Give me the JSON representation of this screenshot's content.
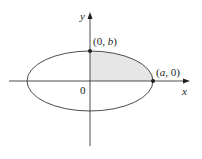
{
  "diagram": {
    "type": "ellipse-quadrant",
    "colors": {
      "stroke": "#3a3a3a",
      "shade": "#e6e6e6",
      "background": "#ffffff"
    },
    "axes": {
      "x_label": "x",
      "y_label": "y",
      "origin_label": "0"
    },
    "points": [
      {
        "label_open": "(0, ",
        "label_var": "b",
        "label_close": ")"
      },
      {
        "label_open": "(",
        "label_var": "a",
        "label_close": ", 0)"
      }
    ],
    "shaded_region": "first quadrant of ellipse"
  }
}
